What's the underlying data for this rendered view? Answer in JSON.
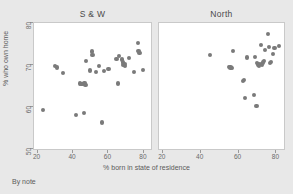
{
  "figure": {
    "note": "By note",
    "xlabel": "% born in state of residence",
    "ylabel": "% who own home",
    "marker_color": "#7a7a7a",
    "background_color": "#e8e8e8",
    "panel_color": "#ffffff"
  },
  "chart_data": {
    "type": "scatter",
    "title": "",
    "xlabel": "% born in state of residence",
    "ylabel": "% who own home",
    "xlim": [
      18,
      84
    ],
    "ylim": [
      50,
      80
    ],
    "xticks": [
      20,
      40,
      60,
      80
    ],
    "yticks": [
      50,
      60,
      70,
      80
    ],
    "grid": false,
    "legend": null,
    "panels": [
      {
        "label": "S & W",
        "xlim": [
          18,
          84
        ],
        "ylim": [
          50,
          80
        ],
        "xticks": [
          20,
          40,
          60,
          80
        ],
        "yticks": [
          50,
          60,
          70,
          80
        ],
        "points": [
          {
            "x": 23.0,
            "y": 59.3
          },
          {
            "x": 30.0,
            "y": 69.7
          },
          {
            "x": 31.0,
            "y": 69.4
          },
          {
            "x": 34.5,
            "y": 68.0
          },
          {
            "x": 41.5,
            "y": 58.0
          },
          {
            "x": 44.0,
            "y": 65.6
          },
          {
            "x": 44.8,
            "y": 65.4
          },
          {
            "x": 45.5,
            "y": 65.5
          },
          {
            "x": 46.2,
            "y": 58.6
          },
          {
            "x": 46.5,
            "y": 65.8
          },
          {
            "x": 47.0,
            "y": 65.3
          },
          {
            "x": 47.5,
            "y": 70.9
          },
          {
            "x": 49.5,
            "y": 68.7
          },
          {
            "x": 50.5,
            "y": 73.2
          },
          {
            "x": 51.0,
            "y": 72.4
          },
          {
            "x": 53.0,
            "y": 68.3
          },
          {
            "x": 54.5,
            "y": 69.7
          },
          {
            "x": 56.5,
            "y": 56.3
          },
          {
            "x": 57.5,
            "y": 68.5
          },
          {
            "x": 60.0,
            "y": 69.0
          },
          {
            "x": 64.5,
            "y": 71.5
          },
          {
            "x": 65.5,
            "y": 65.6
          },
          {
            "x": 66.0,
            "y": 72.1
          },
          {
            "x": 67.5,
            "y": 71.3
          },
          {
            "x": 68.0,
            "y": 70.6
          },
          {
            "x": 68.5,
            "y": 70.0
          },
          {
            "x": 69.0,
            "y": 70.3
          },
          {
            "x": 69.5,
            "y": 69.8
          },
          {
            "x": 71.5,
            "y": 71.7
          },
          {
            "x": 74.5,
            "y": 68.4
          },
          {
            "x": 76.5,
            "y": 75.2
          },
          {
            "x": 77.0,
            "y": 73.3
          },
          {
            "x": 77.5,
            "y": 72.8
          },
          {
            "x": 79.5,
            "y": 68.9
          }
        ]
      },
      {
        "label": "North",
        "xlim": [
          18,
          84
        ],
        "ylim": [
          50,
          80
        ],
        "xticks": [
          20,
          40,
          60,
          80
        ],
        "yticks": [
          50,
          60,
          70,
          80
        ],
        "points": [
          {
            "x": 44.8,
            "y": 72.4
          },
          {
            "x": 55.0,
            "y": 69.6
          },
          {
            "x": 55.8,
            "y": 69.4
          },
          {
            "x": 56.5,
            "y": 69.2
          },
          {
            "x": 57.0,
            "y": 73.3
          },
          {
            "x": 62.5,
            "y": 66.2
          },
          {
            "x": 63.0,
            "y": 66.5
          },
          {
            "x": 63.5,
            "y": 62.2
          },
          {
            "x": 64.5,
            "y": 71.8
          },
          {
            "x": 68.0,
            "y": 62.8
          },
          {
            "x": 68.5,
            "y": 72.0
          },
          {
            "x": 69.5,
            "y": 60.2
          },
          {
            "x": 69.8,
            "y": 70.5
          },
          {
            "x": 70.2,
            "y": 70.1
          },
          {
            "x": 70.8,
            "y": 69.8
          },
          {
            "x": 71.2,
            "y": 70.3
          },
          {
            "x": 71.8,
            "y": 74.8
          },
          {
            "x": 72.5,
            "y": 70.0
          },
          {
            "x": 73.0,
            "y": 70.6
          },
          {
            "x": 73.5,
            "y": 71.0
          },
          {
            "x": 74.0,
            "y": 73.5
          },
          {
            "x": 75.5,
            "y": 77.4
          },
          {
            "x": 76.0,
            "y": 74.2
          },
          {
            "x": 76.5,
            "y": 70.4
          },
          {
            "x": 77.0,
            "y": 70.8
          },
          {
            "x": 78.0,
            "y": 72.6
          },
          {
            "x": 79.0,
            "y": 74.0
          },
          {
            "x": 81.5,
            "y": 74.6
          }
        ]
      }
    ]
  }
}
